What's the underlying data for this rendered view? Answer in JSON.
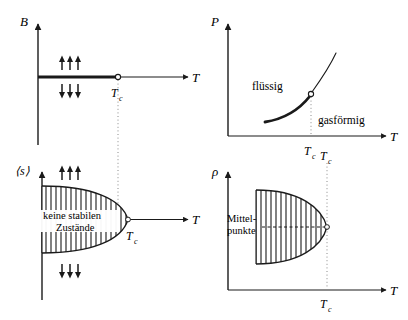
{
  "figure": {
    "background": "#ffffff",
    "ink": "#1a1a1a",
    "panels": [
      {
        "id": "magnet-phase-diagram",
        "position": "top-left",
        "y_axis_label": "B",
        "x_axis_label": "T",
        "critical_label": "T",
        "critical_sub": "c",
        "annotations": [
          {
            "name": "spins-up",
            "text": "↑↑↑"
          },
          {
            "name": "spins-down",
            "text": "↓↓↓"
          }
        ]
      },
      {
        "id": "fluid-phase-diagram",
        "position": "top-right",
        "y_axis_label": "P",
        "x_axis_label": "T",
        "critical_label": "T",
        "critical_sub": "c",
        "region_liquid": "flüssig",
        "region_gas": "gasförmig"
      },
      {
        "id": "magnetization-order-parameter",
        "position": "bottom-left",
        "y_axis_label": "⟨s⟩",
        "x_axis_label": "T",
        "critical_label": "T",
        "critical_sub": "c",
        "region_text_line1": "keine stabilen",
        "region_text_line2": "Zustände",
        "annotations": [
          {
            "name": "spins-up",
            "text": "↑↑↑"
          },
          {
            "name": "spins-down",
            "text": "↓↓↓"
          }
        ]
      },
      {
        "id": "density-order-parameter",
        "position": "bottom-right",
        "y_axis_label": "ρ",
        "x_axis_label": "T",
        "critical_label": "T",
        "critical_sub": "c",
        "midpoints_line1": "Mittel-",
        "midpoints_line2": "punkte"
      }
    ]
  }
}
